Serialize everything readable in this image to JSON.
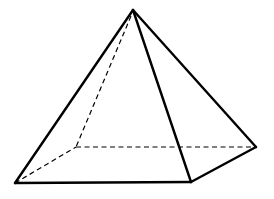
{
  "diagram": {
    "type": "3d-solid-wireframe",
    "stroke_color": "#000000",
    "background": "#ffffff",
    "vertices": {
      "apex": [
        133,
        10
      ],
      "front_left": [
        15,
        183
      ],
      "front_right": [
        191,
        182
      ],
      "back_right": [
        256,
        147
      ],
      "back_left": [
        76,
        147
      ]
    },
    "visible_edges": [
      [
        "apex",
        "front_left"
      ],
      [
        "apex",
        "front_right"
      ],
      [
        "apex",
        "back_right"
      ],
      [
        "front_left",
        "front_right"
      ],
      [
        "front_right",
        "back_right"
      ]
    ],
    "hidden_edges": [
      [
        "apex",
        "back_left"
      ],
      [
        "front_left",
        "back_left"
      ],
      [
        "back_left",
        "back_right"
      ]
    ]
  }
}
